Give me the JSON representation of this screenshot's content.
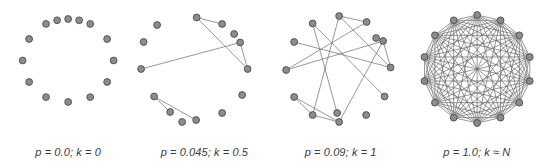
{
  "figure": {
    "node_count": 14,
    "colors": {
      "background": "#ffffff",
      "node_fill": "#8c8c8c",
      "node_stroke": "#4d4d4d",
      "edge": "#6b6b6b",
      "caption_text": "#3a3a3a"
    },
    "node_radius": 3.4,
    "edge_width": 0.7
  },
  "panels": [
    {
      "id": "panel-ring-lattice",
      "caption": "p = 0.0; k = 0",
      "p": "0.0",
      "k": "0",
      "layout": "circle",
      "nodes": [
        {
          "x": 68.0,
          "y": 19.0
        },
        {
          "x": 90.1,
          "y": 23.9
        },
        {
          "x": 107.0,
          "y": 39.0
        },
        {
          "x": 113.5,
          "y": 60.5
        },
        {
          "x": 107.0,
          "y": 82.0
        },
        {
          "x": 90.1,
          "y": 97.1
        },
        {
          "x": 68.0,
          "y": 102.0
        },
        {
          "x": 45.9,
          "y": 97.1
        },
        {
          "x": 29.0,
          "y": 82.0
        },
        {
          "x": 22.5,
          "y": 60.5
        },
        {
          "x": 29.0,
          "y": 39.0
        },
        {
          "x": 45.9,
          "y": 23.9
        },
        {
          "x": 57.0,
          "y": 20.3
        },
        {
          "x": 79.0,
          "y": 20.3
        }
      ],
      "edges": []
    },
    {
      "id": "panel-p-0045",
      "caption": "p = 0.045; k = 0.5",
      "p": "0.045",
      "k": "0.5",
      "layout": "random",
      "nodes": [
        {
          "x": 60.5,
          "y": 17.5
        },
        {
          "x": 86.0,
          "y": 24.0
        },
        {
          "x": 21.0,
          "y": 25.0
        },
        {
          "x": 104.0,
          "y": 42.5
        },
        {
          "x": 7.5,
          "y": 42.0
        },
        {
          "x": 111.5,
          "y": 69.0
        },
        {
          "x": 5.0,
          "y": 69.0
        },
        {
          "x": 18.0,
          "y": 96.5
        },
        {
          "x": 34.0,
          "y": 112.0
        },
        {
          "x": 60.0,
          "y": 120.0
        },
        {
          "x": 86.0,
          "y": 113.0
        },
        {
          "x": 106.0,
          "y": 95.0
        },
        {
          "x": 98.0,
          "y": 34.0
        },
        {
          "x": 46.0,
          "y": 122.0
        }
      ],
      "edges": [
        [
          0,
          1
        ],
        [
          0,
          5
        ],
        [
          3,
          5
        ],
        [
          3,
          6
        ],
        [
          7,
          8
        ],
        [
          7,
          9
        ]
      ]
    },
    {
      "id": "panel-p-009",
      "caption": "p = 0.09; k = 1",
      "p": "0.09",
      "k": "1",
      "layout": "random",
      "nodes": [
        {
          "x": 66.0,
          "y": 16.0
        },
        {
          "x": 93.5,
          "y": 22.0
        },
        {
          "x": 39.5,
          "y": 23.5
        },
        {
          "x": 110.0,
          "y": 41.0
        },
        {
          "x": 21.0,
          "y": 42.0
        },
        {
          "x": 117.5,
          "y": 67.5
        },
        {
          "x": 13.0,
          "y": 70.0
        },
        {
          "x": 21.0,
          "y": 97.0
        },
        {
          "x": 39.5,
          "y": 115.0
        },
        {
          "x": 66.0,
          "y": 122.0
        },
        {
          "x": 93.0,
          "y": 115.0
        },
        {
          "x": 111.5,
          "y": 96.5
        },
        {
          "x": 103.0,
          "y": 38.0
        },
        {
          "x": 64.0,
          "y": 113.0
        }
      ],
      "edges": [
        [
          0,
          1
        ],
        [
          0,
          8
        ],
        [
          1,
          6
        ],
        [
          2,
          13
        ],
        [
          3,
          6
        ],
        [
          3,
          5
        ],
        [
          3,
          9
        ],
        [
          4,
          5
        ],
        [
          5,
          0
        ],
        [
          7,
          8
        ],
        [
          7,
          9
        ],
        [
          8,
          9
        ],
        [
          11,
          2
        ]
      ]
    },
    {
      "id": "panel-complete",
      "caption": "p = 1.0; k ≈ N",
      "p": "1.0",
      "k": "≈ N",
      "layout": "complete",
      "center": {
        "x": 68.0,
        "y": 69.0
      },
      "radius": 54.0,
      "start_angle_deg": -90
    }
  ]
}
